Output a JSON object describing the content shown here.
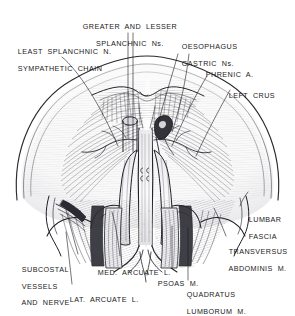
{
  "figure": {
    "kind": "anatomical-line-drawing",
    "style": "pen-and-ink stipple / hatch engraving, black ink on white",
    "ink_color": "#1a1a1a",
    "paper_color": "#ffffff"
  },
  "labels": [
    {
      "id": "greater-lesser-splanchnic",
      "lines": [
        "GREATER  AND  LESSER",
        "SPLANCHNIC  Ns."
      ],
      "align": "center"
    },
    {
      "id": "least-splanchnic-sympathetic",
      "lines": [
        "LEAST  SPLANCHNIC  N.",
        "SYMPATHETIC  CHAIN"
      ],
      "align": "left"
    },
    {
      "id": "oesophagus-gastric",
      "lines": [
        "OESOPHAGUS",
        "GASTRIC  Ns."
      ],
      "align": "left"
    },
    {
      "id": "phrenic-artery",
      "lines": [
        "PHRENIC  A."
      ],
      "align": "left"
    },
    {
      "id": "left-crus",
      "lines": [
        "LEFT  CRUS"
      ],
      "align": "left"
    },
    {
      "id": "lumbar-fascia",
      "lines": [
        "LUMBAR",
        "FASCIA"
      ],
      "align": "left"
    },
    {
      "id": "transversus-abdominis",
      "lines": [
        "TRANSVERSUS",
        "ABDOMINIS  M."
      ],
      "align": "left"
    },
    {
      "id": "subcostal-vessels-nerve",
      "lines": [
        "SUBCOSTAL",
        "VESSELS",
        "AND  NERVE"
      ],
      "align": "left"
    },
    {
      "id": "lat-arcuate-ligament",
      "lines": [
        "LAT.  ARCUATE  L."
      ],
      "align": "left"
    },
    {
      "id": "med-arcuate-ligament",
      "lines": [
        "MED.  ARCUATE  L."
      ],
      "align": "left"
    },
    {
      "id": "psoas-muscle",
      "lines": [
        "PSOAS  M."
      ],
      "align": "left"
    },
    {
      "id": "quadratus-lumborum",
      "lines": [
        "QUADRATUS",
        "LUMBORUM  M."
      ],
      "align": "left"
    }
  ]
}
